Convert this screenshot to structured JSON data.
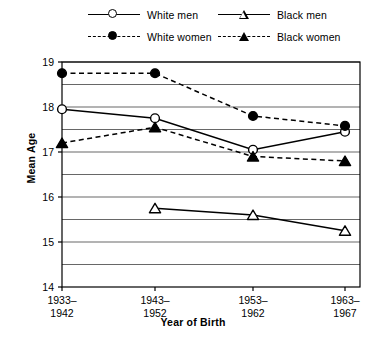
{
  "chart_data": {
    "type": "line",
    "title": "",
    "xlabel": "Year of Birth",
    "ylabel": "Mean Age",
    "categories": [
      "1933–\n1942",
      "1943–\n1952",
      "1953–\n1962",
      "1963–\n1967"
    ],
    "category_lines": [
      [
        "1933–",
        "1942"
      ],
      [
        "1943–",
        "1952"
      ],
      [
        "1953–",
        "1962"
      ],
      [
        "1963–",
        "1967"
      ]
    ],
    "ylim": [
      14,
      19
    ],
    "yticks": [
      14,
      15,
      16,
      17,
      18,
      19
    ],
    "ytick_labels": [
      "14",
      "15",
      "16",
      "17",
      "18",
      "19"
    ],
    "grid": true,
    "grid_minor_step": 0.5,
    "legend_position": "top",
    "series": [
      {
        "name": "White men",
        "marker": "open-circle",
        "line": "solid",
        "color": "#000000",
        "values": [
          17.95,
          17.75,
          17.05,
          17.45
        ]
      },
      {
        "name": "White women",
        "marker": "filled-circle",
        "line": "dashed",
        "color": "#000000",
        "values": [
          18.75,
          18.75,
          17.8,
          17.58
        ]
      },
      {
        "name": "Black men",
        "marker": "open-triangle",
        "line": "solid",
        "color": "#000000",
        "values": [
          null,
          15.75,
          15.6,
          15.25
        ]
      },
      {
        "name": "Black women",
        "marker": "filled-triangle",
        "line": "dashed",
        "color": "#000000",
        "values": [
          17.2,
          17.55,
          16.9,
          16.8
        ]
      }
    ]
  },
  "legend": {
    "items": [
      {
        "label": "White men",
        "marker": "open-circle",
        "line": "solid"
      },
      {
        "label": "Black men",
        "marker": "open-triangle",
        "line": "solid"
      },
      {
        "label": "White women",
        "marker": "filled-circle",
        "line": "dashed"
      },
      {
        "label": "Black women",
        "marker": "filled-triangle",
        "line": "dashed"
      }
    ]
  },
  "axes": {
    "y_title": "Mean Age",
    "x_title": "Year of Birth"
  }
}
